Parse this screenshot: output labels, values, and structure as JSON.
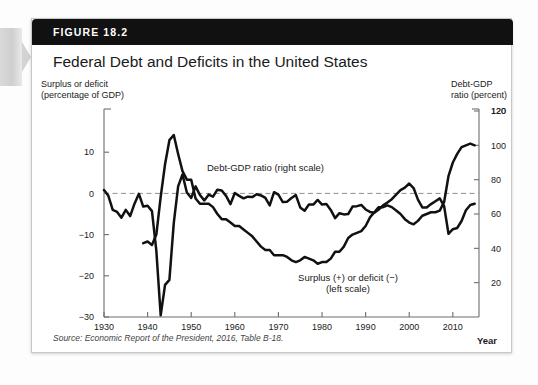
{
  "figure": {
    "number_label": "FIGURE 18.2",
    "title": "Federal Debt and Deficits in the United States",
    "source_prefix": "Source:",
    "source_text": "Economic Report of the President, 2016, Table B-18."
  },
  "axes": {
    "left_caption_line1": "Surplus or deficit",
    "left_caption_line2": "(percentage of GDP)",
    "right_caption_line1": "Debt-GDP",
    "right_caption_line2": "ratio (percent)",
    "x_axis_label": "Year"
  },
  "annotations": {
    "debt_label": "Debt-GDP ratio (right scale)",
    "deficit_label_line1": "Surplus (+) or deficit (−)",
    "deficit_label_line2": "(left scale)"
  },
  "colors": {
    "header_bar": "#111111",
    "series_line": "#111111",
    "zero_line": "#8e8e8e",
    "axis": "#6d6d6d",
    "card_bg": "#ffffff"
  },
  "chart_data": {
    "type": "line",
    "title": "Federal Debt and Deficits in the United States",
    "xlabel": "Year",
    "ylabel": "Surplus or deficit (percentage of GDP)",
    "y2label": "Debt-GDP ratio (percent)",
    "xlim": [
      1930,
      2016
    ],
    "ylim": [
      -30,
      20
    ],
    "y2lim": [
      0,
      120
    ],
    "grid": false,
    "legend": "in-plot annotations",
    "x_ticks": [
      1930,
      1940,
      1950,
      1960,
      1970,
      1980,
      1990,
      2000,
      2010
    ],
    "y_ticks": [
      10,
      0,
      -10,
      -20,
      -30
    ],
    "y2_ticks": [
      20,
      40,
      60,
      80,
      100,
      120
    ],
    "series": [
      {
        "name": "Debt-GDP ratio (right scale)",
        "axis": "right",
        "units": "percent of GDP",
        "x": [
          1939,
          1940,
          1941,
          1942,
          1943,
          1944,
          1945,
          1946,
          1947,
          1948,
          1949,
          1950,
          1951,
          1952,
          1953,
          1954,
          1955,
          1956,
          1957,
          1958,
          1959,
          1960,
          1961,
          1962,
          1963,
          1964,
          1965,
          1966,
          1967,
          1968,
          1969,
          1970,
          1971,
          1972,
          1973,
          1974,
          1975,
          1976,
          1977,
          1978,
          1979,
          1980,
          1981,
          1982,
          1983,
          1984,
          1985,
          1986,
          1987,
          1988,
          1989,
          1990,
          1991,
          1992,
          1993,
          1994,
          1995,
          1996,
          1997,
          1998,
          1999,
          2000,
          2001,
          2002,
          2003,
          2004,
          2005,
          2006,
          2007,
          2008,
          2009,
          2010,
          2011,
          2012,
          2013,
          2014,
          2015
        ],
        "values": [
          43,
          44,
          42,
          48,
          70,
          89,
          103,
          106,
          95,
          85,
          80,
          80,
          69,
          66,
          66,
          66,
          64,
          60,
          57,
          57,
          55,
          53,
          53,
          51,
          49,
          47,
          44,
          41,
          39,
          39,
          36,
          36,
          36,
          35,
          33,
          32,
          33,
          35,
          34,
          33,
          31,
          32,
          32,
          34,
          38,
          38,
          41,
          46,
          48,
          49,
          50,
          53,
          58,
          61,
          64,
          64,
          65,
          64,
          62,
          60,
          57,
          55,
          54,
          56,
          59,
          60,
          61,
          61,
          62,
          67,
          82,
          90,
          95,
          99,
          100,
          101,
          100
        ],
        "peak": {
          "year": 1946,
          "value": 106
        }
      },
      {
        "name": "Surplus (+) or deficit (−) (left scale)",
        "axis": "left",
        "units": "percent of GDP",
        "x": [
          1930,
          1931,
          1932,
          1933,
          1934,
          1935,
          1936,
          1937,
          1938,
          1939,
          1940,
          1941,
          1942,
          1943,
          1944,
          1945,
          1946,
          1947,
          1948,
          1949,
          1950,
          1951,
          1952,
          1953,
          1954,
          1955,
          1956,
          1957,
          1958,
          1959,
          1960,
          1961,
          1962,
          1963,
          1964,
          1965,
          1966,
          1967,
          1968,
          1969,
          1970,
          1971,
          1972,
          1973,
          1974,
          1975,
          1976,
          1977,
          1978,
          1979,
          1980,
          1981,
          1982,
          1983,
          1984,
          1985,
          1986,
          1987,
          1988,
          1989,
          1990,
          1991,
          1992,
          1993,
          1994,
          1995,
          1996,
          1997,
          1998,
          1999,
          2000,
          2001,
          2002,
          2003,
          2004,
          2005,
          2006,
          2007,
          2008,
          2009,
          2010,
          2011,
          2012,
          2013,
          2014,
          2015
        ],
        "values": [
          0.8,
          -0.6,
          -4.0,
          -4.5,
          -5.9,
          -4.0,
          -5.5,
          -2.5,
          -0.1,
          -3.2,
          -3.0,
          -4.3,
          -13.9,
          -29.6,
          -22.2,
          -21.0,
          -7.2,
          1.7,
          4.6,
          0.2,
          -1.1,
          1.7,
          -0.4,
          -1.7,
          -0.3,
          -0.8,
          0.9,
          0.7,
          -0.6,
          -2.6,
          0.1,
          -0.6,
          -1.2,
          -0.8,
          -0.9,
          -0.2,
          -0.5,
          -1.1,
          -2.9,
          0.3,
          -0.3,
          -2.1,
          -2.0,
          -1.1,
          -0.4,
          -3.4,
          -4.2,
          -2.7,
          -2.7,
          -1.6,
          -2.7,
          -2.6,
          -4.0,
          -6.0,
          -4.8,
          -5.1,
          -5.0,
          -3.2,
          -3.1,
          -2.8,
          -3.9,
          -4.5,
          -4.7,
          -3.9,
          -2.9,
          -2.2,
          -1.4,
          -0.3,
          0.8,
          1.4,
          2.4,
          1.3,
          -1.5,
          -3.4,
          -3.4,
          -2.6,
          -1.9,
          -1.2,
          -3.1,
          -9.8,
          -8.7,
          -8.4,
          -6.7,
          -4.1,
          -2.8,
          -2.5
        ],
        "trough": {
          "year": 1943,
          "value": -29.6
        }
      }
    ]
  }
}
